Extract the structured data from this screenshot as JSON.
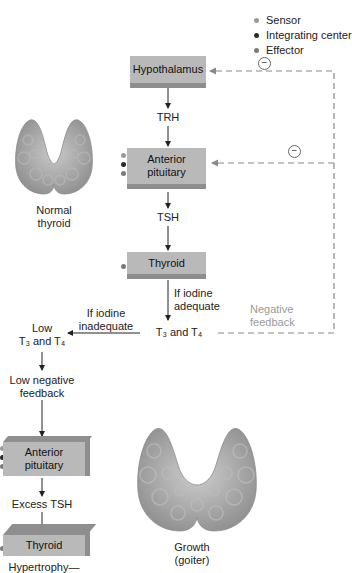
{
  "legend": {
    "items": [
      {
        "label": "Sensor",
        "color": "#9a9a9a"
      },
      {
        "label": "Integrating center",
        "color": "#2a2a2a"
      },
      {
        "label": "Effector",
        "color": "#7a7a7a"
      }
    ]
  },
  "pathway": {
    "hypothalamus": "Hypothalamus",
    "trh": "TRH",
    "anterior_pituitary_line1": "Anterior",
    "anterior_pituitary_line2": "pituitary",
    "tsh": "TSH",
    "thyroid": "Thyroid",
    "if_adequate_line1": "If iodine",
    "if_adequate_line2": "adequate",
    "t3_and_t4": "T₃ and T₄",
    "negative_feedback_line1": "Negative",
    "negative_feedback_line2": "feedback",
    "inhibition_symbol": "−"
  },
  "inadequate_branch": {
    "if_inadequate_line1": "If iodine",
    "if_inadequate_line2": "inadequate",
    "low_t3_t4_line1": "Low",
    "low_t3_t4_line2": "T₃ and T₄",
    "low_neg_feedback_line1": "Low negative",
    "low_neg_feedback_line2": "feedback",
    "anterior_pituitary_line1": "Anterior",
    "anterior_pituitary_line2": "pituitary",
    "excess_tsh": "Excess TSH",
    "thyroid": "Thyroid",
    "hypertrophy": "Hypertrophy—"
  },
  "images": {
    "normal_thyroid_line1": "Normal",
    "normal_thyroid_line2": "thyroid",
    "goiter_line1": "Growth",
    "goiter_line2": "(goiter)"
  },
  "colors": {
    "box_fill": "#b9b9b9",
    "box_shadow": "#8e8e8e",
    "feedback_dash": "#8a8a8a",
    "thyroid_tissue": "#a8a8a8"
  }
}
